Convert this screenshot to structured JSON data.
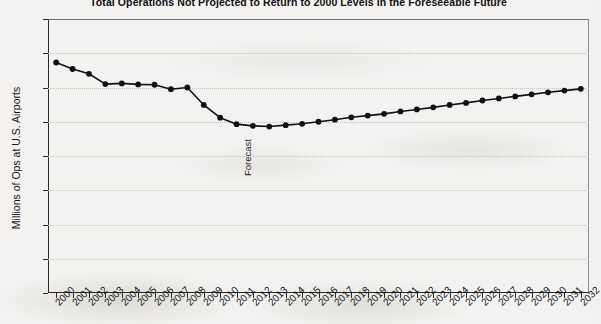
{
  "chart_data": {
    "type": "line",
    "title": "Total Operations Not Projected to Return to 2000 Levels in the Foreseeable Future",
    "xlabel": "",
    "ylabel": "Millions of Ops at U.S. Airports",
    "ylim": [
      0,
      80
    ],
    "ytick_step": 10,
    "yticks": [
      0,
      10,
      20,
      30,
      40,
      50,
      60,
      70,
      80
    ],
    "grid": true,
    "legend": "none",
    "marker": "filled-circle",
    "line_color": "#111111",
    "categories": [
      "2000",
      "2001",
      "2002",
      "2003",
      "2004",
      "2005",
      "2006",
      "2007",
      "2008",
      "2009",
      "2010",
      "2011",
      "2012",
      "2013",
      "2014",
      "2015",
      "2016",
      "2017",
      "2018",
      "2019",
      "2020",
      "2021",
      "2022",
      "2023",
      "2024",
      "2025",
      "2026",
      "2027",
      "2028",
      "2029",
      "2030",
      "2031",
      "2032"
    ],
    "values": [
      67.3,
      65.4,
      64.0,
      61.0,
      61.2,
      60.9,
      60.8,
      59.5,
      60.0,
      54.9,
      51.2,
      49.3,
      48.8,
      48.6,
      49.0,
      49.4,
      50.0,
      50.6,
      51.3,
      51.8,
      52.3,
      53.0,
      53.6,
      54.2,
      54.9,
      55.5,
      56.2,
      56.8,
      57.4,
      58.0,
      58.6,
      59.1,
      59.6
    ],
    "annotations": [
      {
        "text": "Forecast",
        "at_category": "2011",
        "orientation": "vertical"
      }
    ]
  }
}
